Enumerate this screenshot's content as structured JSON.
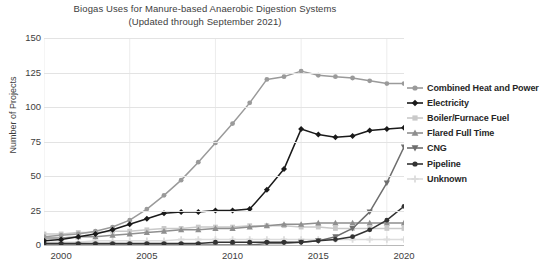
{
  "chart_data": {
    "type": "line",
    "title": "Biogas Uses for Manure-based Anaerobic Digestion Systems",
    "subtitle": "(Updated through September 2021)",
    "xlabel": "",
    "ylabel": "Number of Projects",
    "ylim": [
      0,
      150
    ],
    "yticks": [
      0,
      25,
      50,
      75,
      100,
      125,
      150
    ],
    "xlim": [
      2000,
      2021
    ],
    "xticks": [
      2000,
      2005,
      2010,
      2015,
      2020
    ],
    "grid": true,
    "legend_position": "right",
    "x": [
      2000,
      2001,
      2002,
      2003,
      2004,
      2005,
      2006,
      2007,
      2008,
      2009,
      2010,
      2011,
      2012,
      2013,
      2014,
      2015,
      2016,
      2017,
      2018,
      2019,
      2020,
      2021
    ],
    "series": [
      {
        "name": "Combined Heat and Power",
        "color": "#9a9a9a",
        "marker": "circle",
        "values": [
          6,
          7,
          8,
          10,
          13,
          18,
          26,
          36,
          47,
          60,
          74,
          88,
          103,
          120,
          122,
          126,
          123,
          122,
          121,
          119,
          117,
          117
        ]
      },
      {
        "name": "Electricity",
        "color": "#1a1a1a",
        "marker": "diamond",
        "values": [
          3,
          4,
          6,
          8,
          11,
          15,
          19,
          23,
          24,
          24,
          25,
          25,
          26,
          40,
          55,
          84,
          80,
          78,
          79,
          83,
          84,
          85
        ]
      },
      {
        "name": "Boiler/Furnace Fuel",
        "color": "#c9c9c9",
        "marker": "square",
        "values": [
          8,
          8,
          9,
          9,
          10,
          10,
          11,
          12,
          12,
          13,
          13,
          13,
          14,
          14,
          14,
          13,
          13,
          12,
          12,
          12,
          12,
          12
        ]
      },
      {
        "name": "Flared Full Time",
        "color": "#8f8f8f",
        "marker": "triangle",
        "values": [
          5,
          5,
          6,
          6,
          7,
          8,
          9,
          10,
          11,
          11,
          12,
          12,
          13,
          14,
          15,
          15,
          16,
          16,
          16,
          16,
          16,
          16
        ]
      },
      {
        "name": "CNG",
        "color": "#6e6e6e",
        "marker": "tri-down",
        "values": [
          0,
          0,
          0,
          0,
          0,
          0,
          0,
          0,
          0,
          0,
          0,
          0,
          0,
          1,
          1,
          2,
          3,
          6,
          12,
          24,
          45,
          71
        ]
      },
      {
        "name": "Pipeline",
        "color": "#333333",
        "marker": "circle",
        "values": [
          1,
          1,
          1,
          1,
          1,
          1,
          1,
          1,
          1,
          1,
          2,
          2,
          2,
          2,
          2,
          2,
          3,
          4,
          6,
          11,
          18,
          28
        ]
      },
      {
        "name": "Unknown",
        "color": "#dcdcdc",
        "marker": "plus",
        "values": [
          2,
          2,
          2,
          3,
          3,
          3,
          3,
          3,
          4,
          4,
          4,
          4,
          4,
          4,
          4,
          4,
          4,
          4,
          4,
          4,
          4,
          4
        ]
      }
    ]
  },
  "axes": {
    "ylabel": "Number of Projects",
    "yticks": [
      "150",
      "125",
      "100",
      "75",
      "50",
      "25",
      "0"
    ],
    "xticks": [
      "2000",
      "2005",
      "2010",
      "2015",
      "2020"
    ]
  }
}
